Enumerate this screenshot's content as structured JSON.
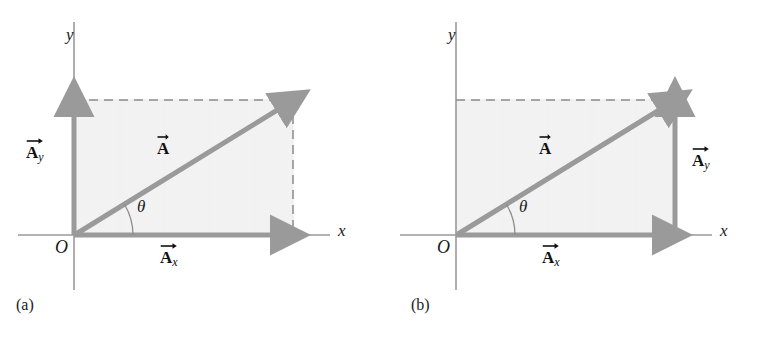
{
  "figure": {
    "background_color": "#ffffff",
    "width": 757,
    "height": 340
  },
  "style": {
    "vector_color": "#9a9a9a",
    "axis_color": "#9a9a9a",
    "dashed_color": "#8c8c8c",
    "shade_fill": "#f2f2f2",
    "shade_stroke": "#e2e2e2",
    "text_color": "#1a1a1a",
    "arc_color": "#8c8c8c"
  },
  "panels": [
    {
      "id": "a",
      "caption": "(a)",
      "axes": {
        "x_label": "x",
        "y_label": "y",
        "origin_label": "O"
      },
      "angle_label": "θ",
      "vectors": [
        {
          "name": "resultant",
          "base": "A",
          "subscript": "",
          "label_text": "A",
          "description": "resultant vector A drawn from origin to corner of rectangle"
        },
        {
          "name": "x-component",
          "base": "A",
          "subscript": "x",
          "label_text": "Ax",
          "description": "horizontal component drawn along x-axis from origin"
        },
        {
          "name": "y-component",
          "base": "A",
          "subscript": "y",
          "label_text": "Ay",
          "description": "vertical component drawn along y-axis from origin"
        }
      ],
      "construction": "components drawn from common origin; dashed lines close the rectangle on top and right"
    },
    {
      "id": "b",
      "caption": "(b)",
      "axes": {
        "x_label": "x",
        "y_label": "y",
        "origin_label": "O"
      },
      "angle_label": "θ",
      "vectors": [
        {
          "name": "resultant",
          "base": "A",
          "subscript": "",
          "label_text": "A",
          "description": "resultant vector A drawn from origin to tip of y-component"
        },
        {
          "name": "x-component",
          "base": "A",
          "subscript": "x",
          "label_text": "Ax",
          "description": "horizontal component drawn along x-axis from origin"
        },
        {
          "name": "y-component",
          "base": "A",
          "subscript": "y",
          "label_text": "Ay",
          "description": "vertical component drawn upward from the head of the x-component"
        }
      ],
      "construction": "components drawn tail-to-head; dashed line closes the rectangle on top only"
    }
  ]
}
